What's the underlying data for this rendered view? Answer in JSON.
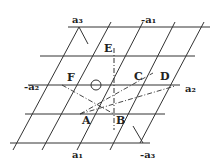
{
  "diagram": {
    "points": [
      {
        "name": "A",
        "label": "A",
        "x": 80,
        "y": 114
      },
      {
        "name": "B",
        "label": "B",
        "x": 114,
        "y": 114
      },
      {
        "name": "C",
        "label": "C",
        "x": 130,
        "y": 85
      },
      {
        "name": "D",
        "label": "D",
        "x": 164,
        "y": 85
      },
      {
        "name": "E",
        "label": "E",
        "x": 114,
        "y": 56
      },
      {
        "name": "F",
        "label": "F",
        "x": 62,
        "y": 85
      },
      {
        "name": "O",
        "label": "",
        "x": 96,
        "y": 85
      }
    ],
    "axis_labels": {
      "a1": "a₁",
      "neg_a1": "-a₁",
      "a2": "a₂",
      "neg_a2": "-a₂",
      "a3": "a₃",
      "neg_a3": "-a₃"
    },
    "grid": {
      "horizontal_y": [
        27,
        56,
        85,
        114,
        143
      ],
      "line_color": "#333333"
    }
  }
}
